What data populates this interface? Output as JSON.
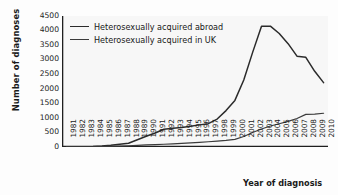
{
  "chart_data": {
    "type": "line",
    "title": "",
    "xlabel": "Year of diagnosis",
    "ylabel": "Number of diagnoses",
    "ylim": [
      0,
      4500
    ],
    "ytick_step": 500,
    "grid": false,
    "legend_position": "top-left",
    "yticks": [
      "4500",
      "4000",
      "3500",
      "3000",
      "2500",
      "2000",
      "1500",
      "1000",
      "500",
      "0"
    ],
    "categories": [
      "1981",
      "1982",
      "1983",
      "1984",
      "1985",
      "1986",
      "1987",
      "1988",
      "1989",
      "1990",
      "1991",
      "1992",
      "1993",
      "1994",
      "1995",
      "1996",
      "1997",
      "1998",
      "1999",
      "2000",
      "2001",
      "2002",
      "2003",
      "2004",
      "2005",
      "2006",
      "2007",
      "2008",
      "2009",
      "2010"
    ],
    "series": [
      {
        "name": "Heterosexually acquired abroad",
        "color": "#2b2b2b",
        "values": [
          5,
          8,
          12,
          20,
          35,
          60,
          95,
          130,
          250,
          370,
          480,
          610,
          640,
          670,
          710,
          760,
          800,
          960,
          1250,
          1600,
          2300,
          3250,
          4150,
          4150,
          3900,
          3550,
          3120,
          3080,
          2600,
          2210
        ]
      },
      {
        "name": "Heterosexually acquired in UK",
        "color": "#3a3a3a",
        "values": [
          2,
          3,
          5,
          8,
          12,
          20,
          30,
          40,
          55,
          70,
          80,
          95,
          110,
          125,
          140,
          160,
          180,
          200,
          225,
          260,
          360,
          500,
          620,
          720,
          800,
          880,
          980,
          1120,
          1130,
          1160
        ]
      }
    ]
  },
  "legend": {
    "items": [
      {
        "label": "Heterosexually acquired abroad"
      },
      {
        "label": "Heterosexually acquired in UK"
      }
    ]
  }
}
